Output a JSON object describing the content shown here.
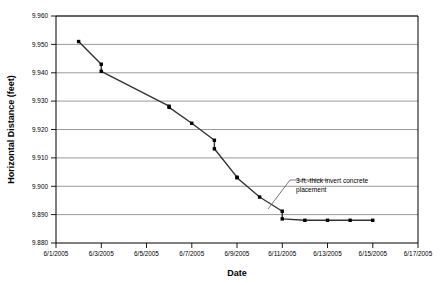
{
  "chart_data": {
    "type": "line",
    "title": "",
    "xlabel": "Date",
    "ylabel": "Horizontal Distance (feet)",
    "xlim": [
      "6/1/2005",
      "6/17/2005"
    ],
    "ylim": [
      9.88,
      9.96
    ],
    "ytick_step": 0.01,
    "grid": true,
    "legend": "none",
    "line_color": "#333333",
    "marker": "square",
    "marker_color": "#000000",
    "x_ticks": [
      "6/1/2005",
      "6/3/2005",
      "6/5/2005",
      "6/7/2005",
      "6/9/2005",
      "6/11/2005",
      "6/13/2005",
      "6/15/2005",
      "6/17/2005"
    ],
    "y_ticks": [
      "9.960",
      "9.950",
      "9.940",
      "9.930",
      "9.920",
      "9.910",
      "9.900",
      "9.890",
      "9.880"
    ],
    "series": [
      {
        "name": "Horizontal Distance",
        "x": [
          "6/2/2005",
          "6/3/2005",
          "6/3/2005",
          "6/6/2005",
          "6/6/2005",
          "6/7/2005",
          "6/8/2005",
          "6/8/2005",
          "6/9/2005",
          "6/9/2005",
          "6/10/2005",
          "6/11/2005",
          "6/11/2005",
          "6/12/2005",
          "6/13/2005",
          "6/14/2005",
          "6/15/2005"
        ],
        "values": [
          9.951,
          9.943,
          9.9405,
          9.9282,
          9.9278,
          9.9222,
          9.9162,
          9.9132,
          9.9032,
          9.903,
          9.8962,
          9.8912,
          9.8885,
          9.888,
          9.888,
          9.888,
          9.888
        ]
      }
    ],
    "annotations": [
      {
        "text_line_1": "3-ft.-thick invert concrete",
        "text_line_2": "placement",
        "points_to": "6/11/2005"
      }
    ]
  }
}
